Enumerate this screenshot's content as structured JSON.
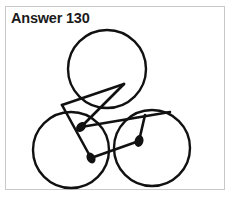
{
  "page": {
    "title": "Answer 130",
    "background_color": "#ffffff",
    "frame_border_color": "#c9c9c9",
    "ink_color": "#111111"
  },
  "figure": {
    "name": "three-circles-three-matchsticks-puzzle-answer",
    "stroke_color": "#111111",
    "circle_stroke_width": 2.4,
    "match_stroke_width": 2.6,
    "circles": [
      {
        "label": "top-circle",
        "cx": 107,
        "cy": 69,
        "r": 39
      },
      {
        "label": "left-circle",
        "cx": 71,
        "cy": 150,
        "r": 38
      },
      {
        "label": "right-circle",
        "cx": 152,
        "cy": 148,
        "r": 38
      }
    ],
    "matchsticks": [
      {
        "label": "matchstick-upper-left",
        "head": {
          "x": 81,
          "y": 127
        },
        "tail": {
          "x": 124,
          "y": 84
        },
        "head_radius": 4.2
      },
      {
        "label": "matchstick-lower",
        "head": {
          "x": 91,
          "y": 158
        },
        "tail": {
          "x": 62,
          "y": 105
        },
        "head_radius": 4.2
      },
      {
        "label": "matchstick-right",
        "head": {
          "x": 139,
          "y": 141
        },
        "tail": {
          "x": 145,
          "y": 115
        },
        "head_radius": 4.4
      }
    ],
    "long_strokes": [
      {
        "label": "stroke-from-top-circle-down-left",
        "x1": 124,
        "y1": 84,
        "x2": 62,
        "y2": 105
      },
      {
        "label": "stroke-from-left-up-right",
        "x1": 81,
        "y1": 127,
        "x2": 170,
        "y2": 112
      },
      {
        "label": "stroke-from-lower-up-right",
        "x1": 91,
        "y1": 158,
        "x2": 139,
        "y2": 141
      }
    ]
  }
}
